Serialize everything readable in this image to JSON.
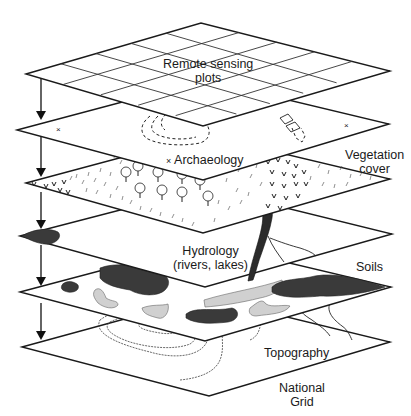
{
  "diagram": {
    "type": "layered GIS overlay diagram",
    "layers": [
      {
        "id": "remote-sensing",
        "label_line1": "Remote sensing",
        "label_line2": "plots"
      },
      {
        "id": "archaeology",
        "label": "Archaeology"
      },
      {
        "id": "vegetation",
        "label_line1": "Vegetation",
        "label_line2": "cover"
      },
      {
        "id": "hydrology",
        "label_line1": "Hydrology",
        "label_line2": "(rivers, lakes)"
      },
      {
        "id": "soils",
        "label": "Soils"
      },
      {
        "id": "topography",
        "label": "Topography"
      },
      {
        "id": "national-grid",
        "label_line1": "National",
        "label_line2": "Grid"
      }
    ],
    "colors": {
      "line": "#1a1a1a",
      "background": "#ffffff",
      "dark_fill": "#3a3a3a",
      "light_fill": "#d0d0d0"
    }
  }
}
